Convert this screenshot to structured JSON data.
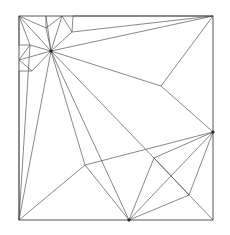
{
  "diagram": {
    "type": "crease-pattern",
    "frame": {
      "x1": 19,
      "y1": 16,
      "x2": 213,
      "y2": 220
    },
    "points": {
      "TL": [
        19,
        16
      ],
      "TR": [
        213,
        16
      ],
      "BR": [
        213,
        220
      ],
      "BL": [
        19,
        220
      ],
      "H": [
        51,
        51
      ],
      "T1": [
        46,
        16
      ],
      "T2": [
        62,
        16
      ],
      "T3": [
        73,
        16
      ],
      "N1": [
        46,
        28
      ],
      "N2": [
        72,
        32
      ],
      "L1": [
        19,
        45
      ],
      "L2": [
        30,
        45
      ],
      "L3": [
        19,
        60
      ],
      "L4": [
        32,
        71
      ],
      "L5": [
        19,
        71
      ],
      "R1": [
        161,
        86
      ],
      "R2": [
        213,
        132
      ],
      "M1": [
        85,
        165
      ],
      "P1": [
        154,
        158
      ],
      "P2": [
        189,
        195
      ],
      "B1": [
        129,
        220
      ]
    },
    "edges": [
      [
        "TL",
        "H"
      ],
      [
        "TL",
        "N1"
      ],
      [
        "TL",
        "L2"
      ],
      [
        "TL",
        "L1"
      ],
      [
        "N1",
        "T1"
      ],
      [
        "N1",
        "T2"
      ],
      [
        "N1",
        "H"
      ],
      [
        "T1",
        "H"
      ],
      [
        "T2",
        "H"
      ],
      [
        "T2",
        "N2"
      ],
      [
        "N2",
        "T3"
      ],
      [
        "N2",
        "TR"
      ],
      [
        "N2",
        "H"
      ],
      [
        "L1",
        "L2"
      ],
      [
        "L2",
        "H"
      ],
      [
        "L2",
        "L3"
      ],
      [
        "L3",
        "H"
      ],
      [
        "L3",
        "L4"
      ],
      [
        "L4",
        "H"
      ],
      [
        "L4",
        "L5"
      ],
      [
        "H",
        "TR"
      ],
      [
        "H",
        "R1"
      ],
      [
        "R1",
        "TR"
      ],
      [
        "R1",
        "R2"
      ],
      [
        "H",
        "BL"
      ],
      [
        "H",
        "M1"
      ],
      [
        "H",
        "P1"
      ],
      [
        "M1",
        "BL"
      ],
      [
        "M1",
        "B1"
      ],
      [
        "L5",
        "BL"
      ],
      [
        "T3",
        "TR"
      ],
      [
        "L2",
        "BL"
      ],
      [
        "P1",
        "R2"
      ],
      [
        "P1",
        "B1"
      ],
      [
        "P1",
        "BR"
      ],
      [
        "R2",
        "B1"
      ],
      [
        "R2",
        "P2"
      ],
      [
        "P2",
        "B1"
      ],
      [
        "B1",
        "H"
      ],
      [
        "M1",
        "R2"
      ],
      [
        "P1",
        "P2"
      ]
    ],
    "marked_nodes": [
      "H",
      "R2",
      "B1"
    ]
  }
}
